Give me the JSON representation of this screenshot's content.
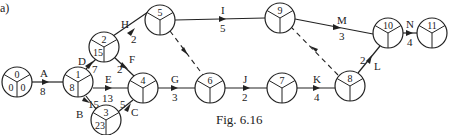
{
  "part_label": "a)",
  "caption": "Fig. 6.16",
  "nodes": [
    {
      "id": "0",
      "cx": 17,
      "cy": 82,
      "number": "0",
      "est": "0",
      "lft": "0"
    },
    {
      "id": "1",
      "cx": 78,
      "cy": 82,
      "number": "1",
      "est": "8",
      "lft": ""
    },
    {
      "id": "2",
      "cx": 104,
      "cy": 47,
      "number": "2",
      "est": "15",
      "lft": ""
    },
    {
      "id": "3",
      "cx": 106,
      "cy": 120,
      "number": "3",
      "est": "23",
      "lft": ""
    },
    {
      "id": "4",
      "cx": 143,
      "cy": 88,
      "number": "4",
      "est": "",
      "lft": ""
    },
    {
      "id": "5",
      "cx": 160,
      "cy": 20,
      "number": "5",
      "est": "",
      "lft": ""
    },
    {
      "id": "6",
      "cx": 210,
      "cy": 88,
      "number": "6",
      "est": "",
      "lft": ""
    },
    {
      "id": "7",
      "cx": 282,
      "cy": 88,
      "number": "7",
      "est": "",
      "lft": ""
    },
    {
      "id": "8",
      "cx": 350,
      "cy": 86,
      "number": "8",
      "est": "",
      "lft": ""
    },
    {
      "id": "9",
      "cx": 280,
      "cy": 18,
      "number": "9",
      "est": "",
      "lft": ""
    },
    {
      "id": "10",
      "cx": 388,
      "cy": 33,
      "number": "10",
      "est": "",
      "lft": ""
    },
    {
      "id": "11",
      "cx": 432,
      "cy": 33,
      "number": "11",
      "est": "",
      "lft": ""
    }
  ],
  "activities": [
    {
      "label": "A",
      "duration": "8",
      "from": "0",
      "to": "1",
      "dummy": false
    },
    {
      "label": "B",
      "duration": "15",
      "from": "1",
      "to": "3",
      "dummy": false
    },
    {
      "label": "C",
      "duration": "5",
      "from": "3",
      "to": "4",
      "dummy": false
    },
    {
      "label": "D",
      "duration": "7",
      "from": "1",
      "to": "2",
      "dummy": false
    },
    {
      "label": "E",
      "duration": "13",
      "from": "1",
      "to": "4",
      "dummy": false
    },
    {
      "label": "F",
      "duration": "2",
      "from": "2",
      "to": "4",
      "dummy": false
    },
    {
      "label": "G",
      "duration": "3",
      "from": "4",
      "to": "6",
      "dummy": false
    },
    {
      "label": "H",
      "duration": "2",
      "from": "2",
      "to": "5",
      "dummy": false
    },
    {
      "label": "I",
      "duration": "5",
      "from": "5",
      "to": "9",
      "dummy": false
    },
    {
      "label": "J",
      "duration": "2",
      "from": "6",
      "to": "7",
      "dummy": false
    },
    {
      "label": "K",
      "duration": "4",
      "from": "7",
      "to": "8",
      "dummy": false
    },
    {
      "label": "L",
      "duration": "2",
      "from": "8",
      "to": "10",
      "dummy": false
    },
    {
      "label": "M",
      "duration": "3",
      "from": "9",
      "to": "10",
      "dummy": false
    },
    {
      "label": "N",
      "duration": "4",
      "from": "10",
      "to": "11",
      "dummy": false
    },
    {
      "label": "",
      "duration": "",
      "from": "5",
      "to": "6",
      "dummy": true
    },
    {
      "label": "",
      "duration": "",
      "from": "8",
      "to": "9",
      "dummy": true
    }
  ],
  "labels": {
    "A": {
      "name": "A",
      "dur": "8"
    },
    "B": {
      "name": "B",
      "dur": "15"
    },
    "C": {
      "name": "C",
      "dur": "5"
    },
    "D": {
      "name": "D",
      "dur": "7"
    },
    "E": {
      "name": "E",
      "dur": "13"
    },
    "F": {
      "name": "F",
      "dur": "2"
    },
    "G": {
      "name": "G",
      "dur": "3"
    },
    "H": {
      "name": "H",
      "dur": "2"
    },
    "I": {
      "name": "I",
      "dur": "5"
    },
    "J": {
      "name": "J",
      "dur": "2"
    },
    "K": {
      "name": "K",
      "dur": "4"
    },
    "L": {
      "name": "L",
      "dur": "2"
    },
    "M": {
      "name": "M",
      "dur": "3"
    },
    "N": {
      "name": "N",
      "dur": "4"
    }
  },
  "node_text": {
    "n0": {
      "num": "0",
      "est": "0",
      "lft": "0"
    },
    "n1": {
      "num": "1",
      "est": "8"
    },
    "n2": {
      "num": "2",
      "est": "15"
    },
    "n3": {
      "num": "3",
      "est": "23"
    },
    "n4": {
      "num": "4"
    },
    "n5": {
      "num": "5"
    },
    "n6": {
      "num": "6"
    },
    "n7": {
      "num": "7"
    },
    "n8": {
      "num": "8"
    },
    "n9": {
      "num": "9"
    },
    "n10": {
      "num": "10"
    },
    "n11": {
      "num": "11"
    }
  }
}
